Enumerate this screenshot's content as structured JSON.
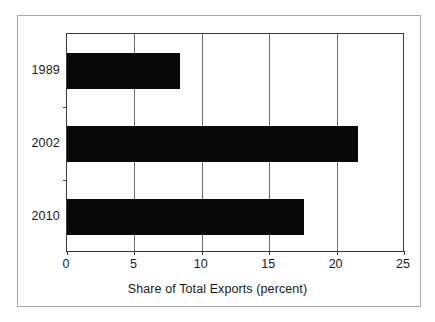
{
  "chart_data": {
    "type": "bar",
    "orientation": "horizontal",
    "title": "",
    "subtitle": "",
    "xlabel": "Share of Total Exports (percent)",
    "ylabel": "",
    "categories": [
      "1989",
      "2002",
      "2010"
    ],
    "values": [
      8.4,
      21.6,
      17.6
    ],
    "series": [
      {
        "name": "Share of Total Exports",
        "values": [
          8.4,
          21.6,
          17.6
        ]
      }
    ],
    "xlim": [
      0,
      25
    ],
    "xticks": [
      0,
      5,
      10,
      15,
      20,
      25
    ],
    "xtick_labels": [
      "0",
      "5",
      "10",
      "15",
      "20",
      "25"
    ],
    "ytick_labels": [
      "1989",
      "2002",
      "2010"
    ],
    "grid": "vertical",
    "legend": "none",
    "annotations": [],
    "colors": {
      "bar": "#080808",
      "gridline": "#6b6b6b",
      "axis": "#3a3a3a",
      "frame": "#a8a8a8",
      "text": "#1a1a1a",
      "background": "#ffffff"
    }
  }
}
